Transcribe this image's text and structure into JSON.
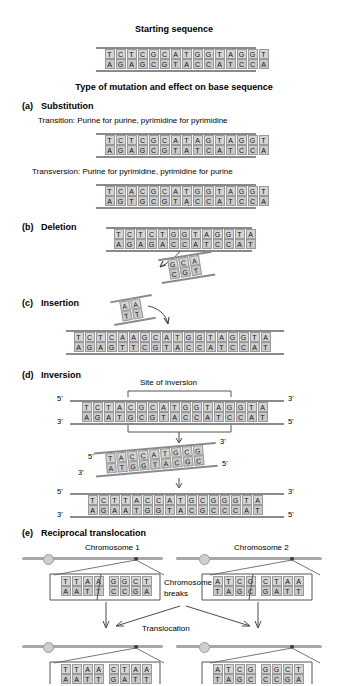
{
  "figure": {
    "starting_title": "Starting sequence",
    "main_title": "Type of mutation and effect on base sequence"
  },
  "starting": {
    "top": "TCTCGCATGGTAGGT",
    "bottom": "AGAGCGTACCATCCA"
  },
  "substitution": {
    "label": "(a)",
    "name": "Substitution",
    "transition_caption": "Transition: Purine for purine, pyrimidine for pyrimidine",
    "transition_top": "TCTCGCATAGTAGGT",
    "transition_bottom": "AGAGCGTATCATCCA",
    "transversion_caption": "Transversion: Purine for pyrimidine, pyrimidine for purine",
    "transversion_top": "TCACGCATGGTAGGT",
    "transversion_bottom": "AGTGCGTACCATCCA"
  },
  "deletion": {
    "label": "(b)",
    "name": "Deletion",
    "top": "TCTCTGGTAGGTA",
    "bottom": "AGAGACCATCCAT",
    "fragment_top": "GCA",
    "fragment_bottom": "CGT"
  },
  "insertion": {
    "label": "(c)",
    "name": "Insertion",
    "fragment_top": "AA",
    "fragment_bottom": "TT",
    "top": "TCTCAAGCATGGTAGGTA",
    "bottom": "AGAGTTCGTACCATCCAT"
  },
  "inversion": {
    "label": "(d)",
    "name": "Inversion",
    "site_caption": "Site of inversion",
    "before_top": "TCTACGCATGGTAGGTA",
    "before_bottom": "AGATGCGTACCATCCAT",
    "fragment_top": "TACCATGCG",
    "fragment_bottom": "ATGGTACGC",
    "after_top": "TCTTACCATGCGGGTA",
    "after_bottom": "AGAATGGTACGCCCAT",
    "five_prime": "5'",
    "three_prime": "3'"
  },
  "translocation": {
    "label": "(e)",
    "name": "Reciprocal translocation",
    "chromosome1": "Chromosome 1",
    "chromosome2": "Chromosome 2",
    "breaks_line1": "Chromosome",
    "breaks_line2": "breaks",
    "translocation_caption": "Translocation",
    "before": {
      "c1_left_top": "TTAA",
      "c1_left_bottom": "AATT",
      "c1_right_top": "GGCT",
      "c1_right_bottom": "CCGA",
      "c2_left_top": "ATCG",
      "c2_left_bottom": "TAGC",
      "c2_right_top": "CTAA",
      "c2_right_bottom": "GATT"
    },
    "after": {
      "c1_left_top": "TTAA",
      "c1_left_bottom": "AATT",
      "c1_right_top": "CTAA",
      "c1_right_bottom": "GATT",
      "c2_left_top": "ATCG",
      "c2_left_bottom": "TAGC",
      "c2_right_top": "GGCT",
      "c2_right_bottom": "CCGA"
    }
  },
  "colors": {
    "base_fill": "#d4d4d4",
    "base_stroke": "#9a9a9a",
    "strand": "#8a8a8a",
    "text": "#000000"
  }
}
